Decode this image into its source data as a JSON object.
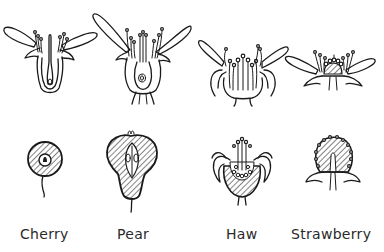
{
  "figure": {
    "ink_color": "#1a1a1a",
    "background": "#ffffff",
    "columns": [
      {
        "id": "cherry",
        "label": "Cherry",
        "flower": "cherry-flower-section",
        "fruit": "cherry-fruit-section"
      },
      {
        "id": "pear",
        "label": "Pear",
        "flower": "pear-flower-section",
        "fruit": "pear-fruit-section"
      },
      {
        "id": "haw",
        "label": "Haw",
        "flower": "haw-flower-section",
        "fruit": "haw-fruit-section"
      },
      {
        "id": "strawberry",
        "label": "Strawberry",
        "flower": "strawberry-flower-section",
        "fruit": "strawberry-fruit-section"
      }
    ]
  }
}
